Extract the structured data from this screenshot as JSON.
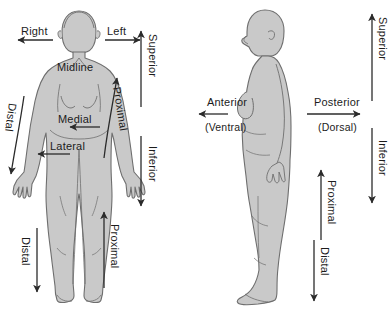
{
  "diagram": {
    "colors": {
      "body_fill": "#c9c9c9",
      "body_stroke": "#6e6e6e",
      "arrow": "#2b2b2b",
      "text": "#1c1c1c",
      "background": "#ffffff"
    },
    "figures": [
      {
        "id": "anterior-view",
        "name": "female-body-anterior-view",
        "description": "Front-facing full body female figure"
      },
      {
        "id": "lateral-view",
        "name": "female-body-lateral-view",
        "description": "Side-facing full body female figure"
      }
    ],
    "labels": {
      "right": "Right",
      "left": "Left",
      "midline": "Midline",
      "medial": "Medial",
      "lateral": "Lateral",
      "superior_left": "Superior",
      "inferior_left": "Inferior",
      "proximal_arm": "Proximal",
      "distal_arm": "Distal",
      "proximal_leg": "Proximal",
      "distal_leg": "Distal",
      "anterior": "Anterior",
      "ventral": "(Ventral)",
      "posterior": "Posterior",
      "dorsal": "(Dorsal)",
      "superior_right": "Superior",
      "inferior_right": "Inferior",
      "proximal_leg_right": "Proximal",
      "distal_leg_right": "Distal"
    },
    "arrows": [
      {
        "name": "right-arrow",
        "direction": "left",
        "label": "Right"
      },
      {
        "name": "left-arrow",
        "direction": "right",
        "label": "Left"
      },
      {
        "name": "medial-arrow",
        "direction": "left",
        "label": "Medial"
      },
      {
        "name": "lateral-arrow",
        "direction": "left",
        "label": "Lateral"
      },
      {
        "name": "superior-arrow-left",
        "direction": "up",
        "label": "Superior"
      },
      {
        "name": "inferior-arrow-left",
        "direction": "down",
        "label": "Inferior"
      },
      {
        "name": "proximal-arm-arrow",
        "direction": "up-right",
        "label": "Proximal"
      },
      {
        "name": "distal-arm-arrow",
        "direction": "down-left",
        "label": "Distal"
      },
      {
        "name": "proximal-leg-arrow",
        "direction": "up",
        "label": "Proximal"
      },
      {
        "name": "distal-leg-arrow",
        "direction": "down",
        "label": "Distal"
      },
      {
        "name": "anterior-arrow",
        "direction": "left",
        "label": "Anterior"
      },
      {
        "name": "posterior-arrow",
        "direction": "right",
        "label": "Posterior"
      },
      {
        "name": "superior-arrow-right",
        "direction": "up",
        "label": "Superior"
      },
      {
        "name": "inferior-arrow-right",
        "direction": "down",
        "label": "Inferior"
      },
      {
        "name": "proximal-leg-arrow-right",
        "direction": "up",
        "label": "Proximal"
      },
      {
        "name": "distal-leg-arrow-right",
        "direction": "down",
        "label": "Distal"
      }
    ]
  }
}
